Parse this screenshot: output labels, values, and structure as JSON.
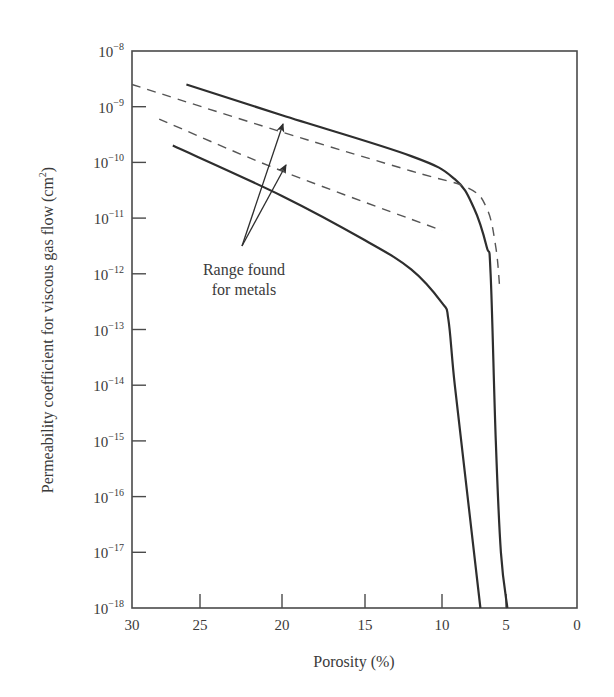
{
  "chart_data": {
    "type": "line",
    "title": "",
    "xlabel": "Porosity (%)",
    "ylabel": "Permeability coefficient for viscous gas flow (cm²)",
    "ylabel_main": "Permeability coefficient for viscous gas flow (cm",
    "ylabel_sup": "2",
    "ylabel_close": ")",
    "x_scale": "linear (reversed, non-uniform tick spacing)",
    "y_scale": "log",
    "xlim": [
      30,
      0
    ],
    "ylim": [
      1e-18,
      1e-08
    ],
    "x_ticks": [
      "30",
      "25",
      "20",
      "15",
      "10",
      "5",
      "0"
    ],
    "y_ticks": [
      {
        "base": "10",
        "exp": "−8"
      },
      {
        "base": "10",
        "exp": "−9"
      },
      {
        "base": "10",
        "exp": "−10"
      },
      {
        "base": "10",
        "exp": "−11"
      },
      {
        "base": "10",
        "exp": "−12"
      },
      {
        "base": "10",
        "exp": "−13"
      },
      {
        "base": "10",
        "exp": "−14"
      },
      {
        "base": "10",
        "exp": "−15"
      },
      {
        "base": "10",
        "exp": "−16"
      },
      {
        "base": "10",
        "exp": "−17"
      },
      {
        "base": "10",
        "exp": "−18"
      }
    ],
    "grid": false,
    "legend": null,
    "series": [
      {
        "name": "Upper bound (solid)",
        "style": "solid",
        "points": [
          [
            26,
            2.5e-09
          ],
          [
            20,
            7e-10
          ],
          [
            12,
            1.3e-10
          ],
          [
            9,
            5e-11
          ],
          [
            7.5,
            1.5e-11
          ],
          [
            6.5,
            3e-12
          ],
          [
            6.2,
            1e-12
          ],
          [
            5.8,
            1e-15
          ],
          [
            5.4,
            1e-17
          ],
          [
            4.9,
            1e-18
          ]
        ]
      },
      {
        "name": "Lower bound (solid)",
        "style": "solid",
        "points": [
          [
            27,
            2e-10
          ],
          [
            20,
            2.5e-11
          ],
          [
            15,
            4e-12
          ],
          [
            12,
            1.2e-12
          ],
          [
            10,
            3e-13
          ],
          [
            9.5,
            1.5e-13
          ],
          [
            9,
            1e-14
          ],
          [
            8,
            1e-16
          ],
          [
            7,
            1e-18
          ]
        ]
      },
      {
        "name": "Range found for metals – upper (dashed)",
        "style": "dashed",
        "points": [
          [
            30,
            2.5e-09
          ],
          [
            20,
            3.5e-10
          ],
          [
            12,
            7e-11
          ],
          [
            8,
            3.5e-11
          ],
          [
            6.5,
            1.5e-11
          ],
          [
            5.8,
            3e-12
          ],
          [
            5.5,
            6e-13
          ]
        ]
      },
      {
        "name": "Range found for metals – lower (dashed)",
        "style": "dashed",
        "points": [
          [
            28,
            6e-10
          ],
          [
            20,
            7e-11
          ],
          [
            10,
            6e-12
          ]
        ]
      }
    ],
    "annotations": [
      {
        "text": "Range found for metals",
        "line1": "Range found",
        "line2": "for metals",
        "arrows_to": [
          [
            20,
            3.5e-10
          ],
          [
            20,
            6e-11
          ]
        ]
      }
    ]
  },
  "colors": {
    "line": "#2e2e2e",
    "dashed": "#555555",
    "axis": "#4a4a4a",
    "background": "#ffffff"
  }
}
